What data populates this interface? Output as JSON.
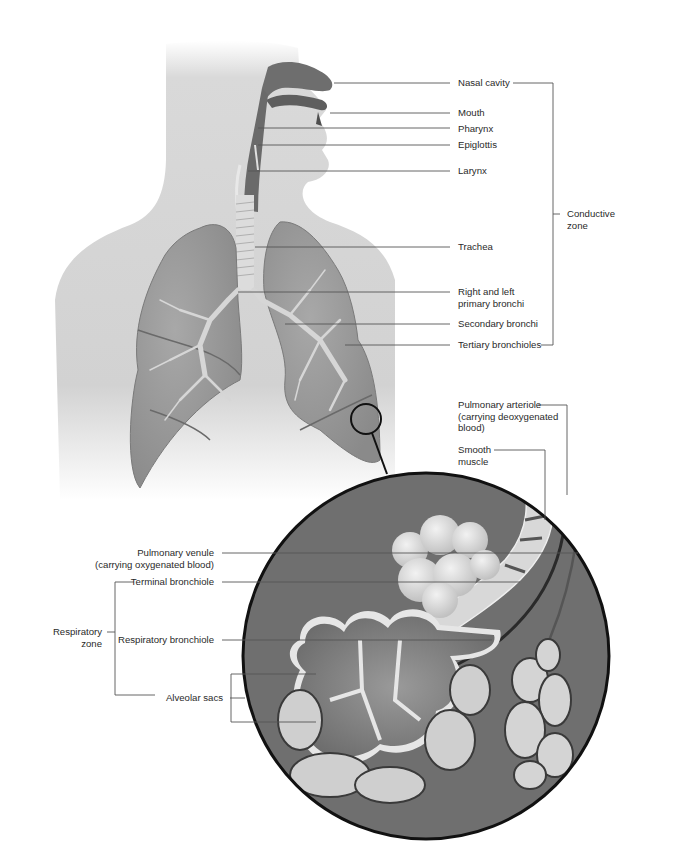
{
  "figure": {
    "colors": {
      "body_silhouette": "#d4d4d4",
      "airway_dark": "#6e6e6e",
      "lung_fill": "#9a9a9a",
      "bronchi_light": "#d8d8d8",
      "inset_background": "#6f6f6f",
      "outline": "#111111",
      "leader_line": "#555555",
      "label_text": "#2a2a2a"
    }
  },
  "labels": {
    "nasal_cavity": "Nasal cavity",
    "mouth": "Mouth",
    "pharynx": "Pharynx",
    "epiglottis": "Epiglottis",
    "larynx": "Larynx",
    "trachea": "Trachea",
    "primary_bronchi_1": "Right and left",
    "primary_bronchi_2": "primary bronchi",
    "secondary_bronchi": "Secondary bronchi",
    "tertiary_bronchioles": "Tertiary bronchioles",
    "conductive_zone_1": "Conductive",
    "conductive_zone_2": "zone",
    "pulmonary_arteriole_1": "Pulmonary arteriole",
    "pulmonary_arteriole_2": "(carrying deoxygenated",
    "pulmonary_arteriole_3": "blood)",
    "smooth_muscle_1": "Smooth",
    "smooth_muscle_2": "muscle",
    "pulmonary_venule_1": "Pulmonary venule",
    "pulmonary_venule_2": "(carrying oxygenated blood)",
    "terminal_bronchiole": "Terminal bronchiole",
    "respiratory_zone_1": "Respiratory",
    "respiratory_zone_2": "zone",
    "respiratory_bronchiole": "Respiratory bronchiole",
    "alveolar_sacs": "Alveolar sacs"
  }
}
